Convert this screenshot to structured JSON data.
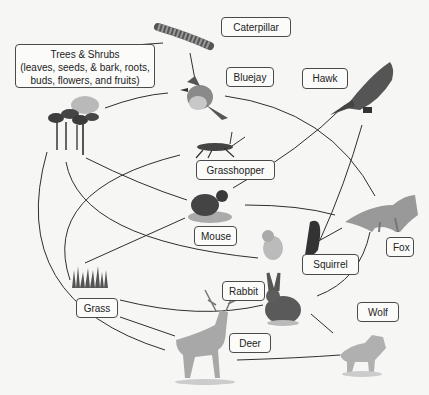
{
  "diagram": {
    "nodes": [
      {
        "id": "trees",
        "label": "Trees & Shrubs",
        "detail": "(leaves, seeds, & bark, roots, buds, flowers, and fruits)",
        "role": "producer"
      },
      {
        "id": "caterpillar",
        "label": "Caterpillar",
        "role": "herbivore"
      },
      {
        "id": "bluejay",
        "label": "Bluejay",
        "role": "omnivore"
      },
      {
        "id": "hawk",
        "label": "Hawk",
        "role": "predator"
      },
      {
        "id": "grasshopper",
        "label": "Grasshopper",
        "role": "herbivore"
      },
      {
        "id": "mouse",
        "label": "Mouse",
        "role": "herbivore"
      },
      {
        "id": "fox",
        "label": "Fox",
        "role": "predator"
      },
      {
        "id": "squirrel",
        "label": "Squirrel",
        "role": "herbivore"
      },
      {
        "id": "grass",
        "label": "Grass",
        "role": "producer"
      },
      {
        "id": "rabbit",
        "label": "Rabbit",
        "role": "herbivore"
      },
      {
        "id": "wolf",
        "label": "Wolf",
        "role": "predator"
      },
      {
        "id": "deer",
        "label": "Deer",
        "role": "herbivore"
      }
    ],
    "edges": [
      {
        "from": "trees",
        "to": "caterpillar"
      },
      {
        "from": "trees",
        "to": "bluejay"
      },
      {
        "from": "caterpillar",
        "to": "bluejay"
      },
      {
        "from": "trees",
        "to": "mouse"
      },
      {
        "from": "trees",
        "to": "squirrel"
      },
      {
        "from": "trees",
        "to": "deer"
      },
      {
        "from": "grass",
        "to": "grasshopper"
      },
      {
        "from": "grass",
        "to": "mouse"
      },
      {
        "from": "grass",
        "to": "rabbit"
      },
      {
        "from": "grass",
        "to": "deer"
      },
      {
        "from": "bluejay",
        "to": "fox"
      },
      {
        "from": "mouse",
        "to": "hawk"
      },
      {
        "from": "mouse",
        "to": "fox"
      },
      {
        "from": "squirrel",
        "to": "hawk"
      },
      {
        "from": "squirrel",
        "to": "fox"
      },
      {
        "from": "rabbit",
        "to": "fox"
      },
      {
        "from": "rabbit",
        "to": "wolf"
      },
      {
        "from": "deer",
        "to": "wolf"
      }
    ]
  },
  "colors": {
    "background": "#f6f6f5",
    "line": "#2f2f2f",
    "label_border": "#4a4a4a"
  }
}
